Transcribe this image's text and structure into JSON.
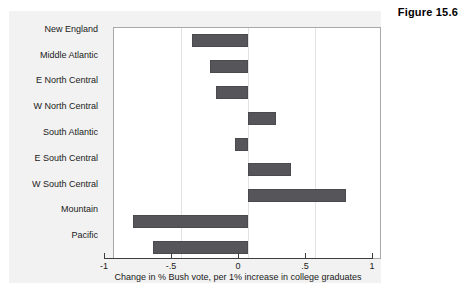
{
  "figure": {
    "number_label": "Figure 15.6"
  },
  "chart_data": {
    "type": "bar",
    "orientation": "horizontal",
    "title": "",
    "xlabel": "Change in % Bush vote, per 1% increase in college graduates",
    "ylabel": "",
    "xlim": [
      -1,
      1
    ],
    "xticks": [
      -1,
      -0.5,
      0,
      0.5,
      1
    ],
    "xticklabels": [
      "-1",
      "-.5",
      "0",
      ".5",
      "1"
    ],
    "grid": true,
    "grid_axis": "x",
    "legend": false,
    "bar_color": "#56565a",
    "categories": [
      "New England",
      "Middle Atlantic",
      "E North Central",
      "W North Central",
      "South Atlantic",
      "E South Central",
      "W South Central",
      "Mountain",
      "Pacific"
    ],
    "values": [
      -0.42,
      -0.28,
      -0.24,
      0.21,
      -0.1,
      0.32,
      0.73,
      -0.86,
      -0.71
    ]
  }
}
